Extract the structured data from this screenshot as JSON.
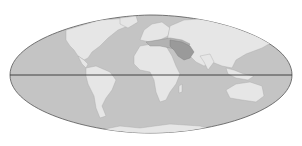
{
  "map": {
    "projection": "Mollweide (world)",
    "colors": {
      "background": "#ffffff",
      "ocean": "#c4c4c4",
      "land": "#e6e6e6",
      "highlight": "#9a9a9a",
      "highlight_light": "#b2b2b2",
      "outline": "#555555",
      "equator": "#333333"
    },
    "highlighted_region": "Middle East",
    "equator_line": true
  }
}
